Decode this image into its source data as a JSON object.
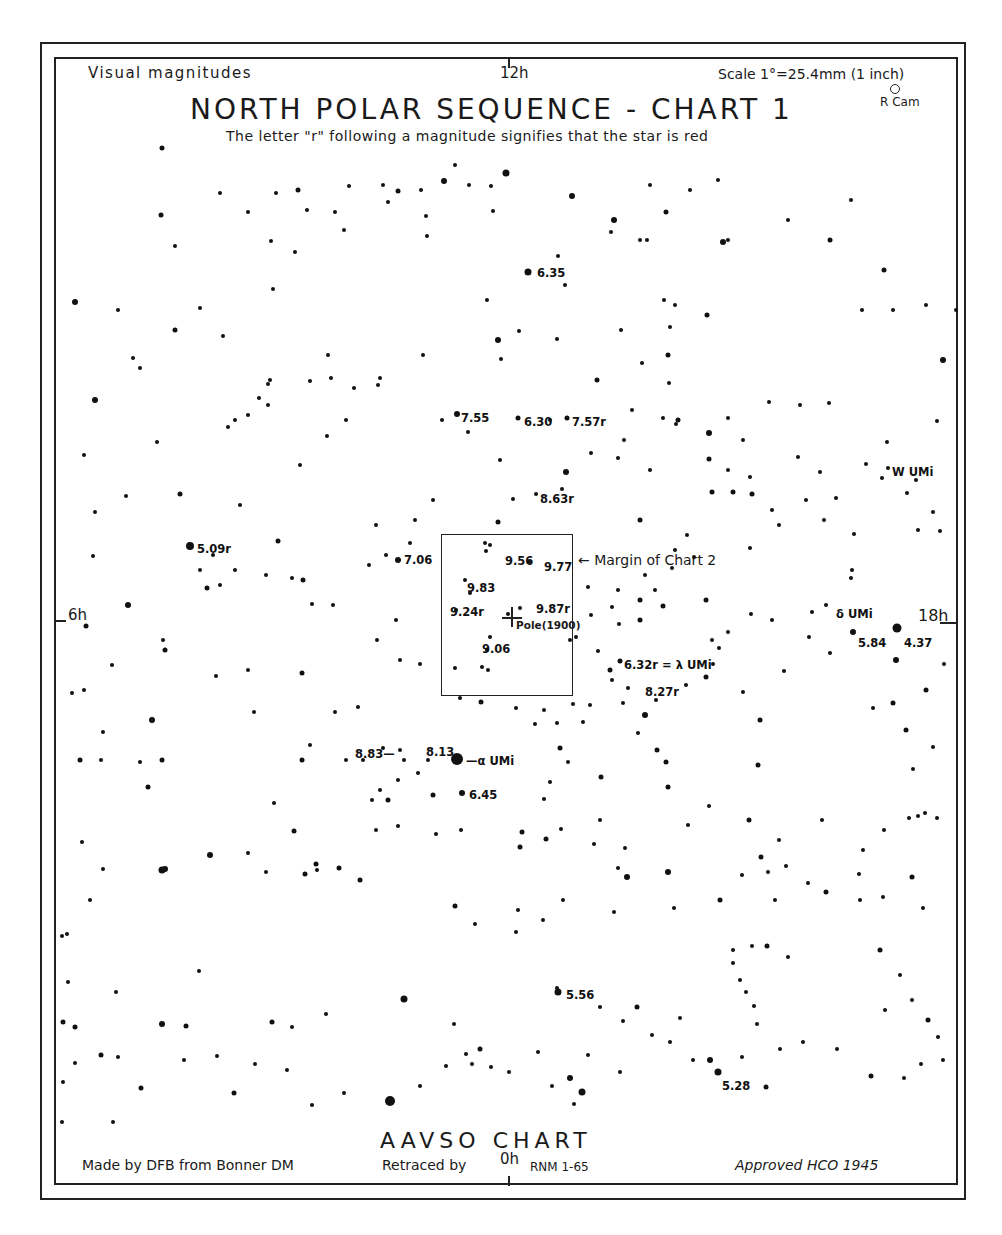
{
  "header": {
    "left": "Visual magnitudes",
    "ra_top": "12h",
    "scale": "Scale 1°=25.4mm (1 inch)",
    "title": "NORTH POLAR SEQUENCE - CHART 1",
    "subtitle": "The letter \"r\" following a magnitude signifies that the star is red",
    "corner_label": "R Cam"
  },
  "ra_marks": {
    "left": "6h",
    "right": "18h",
    "bottom": "0h"
  },
  "inset": {
    "label": "← Margin of Chart 2",
    "pole_label": "Pole(1900)"
  },
  "labels": [
    {
      "text": "6.35",
      "x": 537,
      "y": 264
    },
    {
      "text": "7.55",
      "x": 461,
      "y": 409
    },
    {
      "text": "6.30",
      "x": 524,
      "y": 413
    },
    {
      "text": "7.57r",
      "x": 572,
      "y": 413
    },
    {
      "text": "8.63r",
      "x": 540,
      "y": 490
    },
    {
      "text": "5.09r",
      "x": 197,
      "y": 540
    },
    {
      "text": "7.06",
      "x": 404,
      "y": 551
    },
    {
      "text": "9.56",
      "x": 505,
      "y": 552
    },
    {
      "text": "9.77",
      "x": 544,
      "y": 558
    },
    {
      "text": "9.83",
      "x": 467,
      "y": 579
    },
    {
      "text": "9.24r",
      "x": 450,
      "y": 603
    },
    {
      "text": "9.87r",
      "x": 536,
      "y": 600
    },
    {
      "text": "9.06",
      "x": 482,
      "y": 640
    },
    {
      "text": "6.32r = λ UMi",
      "x": 624,
      "y": 656
    },
    {
      "text": "8.27r",
      "x": 645,
      "y": 683
    },
    {
      "text": "8.83—",
      "x": 355,
      "y": 745
    },
    {
      "text": "8.13",
      "x": 426,
      "y": 743
    },
    {
      "text": "—α UMi",
      "x": 466,
      "y": 752
    },
    {
      "text": "6.45",
      "x": 469,
      "y": 786
    },
    {
      "text": "W UMi",
      "x": 892,
      "y": 463
    },
    {
      "text": "δ UMi",
      "x": 836,
      "y": 605
    },
    {
      "text": "5.84",
      "x": 858,
      "y": 634
    },
    {
      "text": "4.37",
      "x": 904,
      "y": 634
    },
    {
      "text": "5.56",
      "x": 566,
      "y": 986
    },
    {
      "text": "5.28",
      "x": 722,
      "y": 1077
    }
  ],
  "footer": {
    "chart_name": "AAVSO CHART",
    "made_by": "Made by DFB from Bonner DM",
    "retraced": "Retraced by",
    "retraced_by": "RNM 1-65",
    "approved": "Approved HCO 1945"
  },
  "chart_data": {
    "type": "scatter",
    "title": "NORTH POLAR SEQUENCE - CHART 1",
    "subtitle": "The letter \"r\" following a magnitude signifies that the star is red",
    "xlabel": "Right Ascension (hours)",
    "ylabel": "Declination",
    "axis_ticks": {
      "top": "12h",
      "left": "6h",
      "right": "18h",
      "bottom": "0h"
    },
    "scale": "1° = 25.4 mm (1 inch)",
    "magnitude_system": "Visual magnitudes",
    "labeled_stars": [
      {
        "magnitude": "6.35"
      },
      {
        "magnitude": "7.55"
      },
      {
        "magnitude": "6.30"
      },
      {
        "magnitude": "7.57",
        "red": true
      },
      {
        "magnitude": "8.63",
        "red": true
      },
      {
        "magnitude": "5.09",
        "red": true
      },
      {
        "magnitude": "7.06"
      },
      {
        "magnitude": "9.56"
      },
      {
        "magnitude": "9.77"
      },
      {
        "magnitude": "9.83"
      },
      {
        "magnitude": "9.24",
        "red": true
      },
      {
        "magnitude": "9.87",
        "red": true
      },
      {
        "magnitude": "9.06"
      },
      {
        "magnitude": "6.32",
        "red": true,
        "name": "λ UMi"
      },
      {
        "magnitude": "8.27",
        "red": true
      },
      {
        "magnitude": "8.83"
      },
      {
        "magnitude": "8.13"
      },
      {
        "name": "α UMi"
      },
      {
        "magnitude": "6.45"
      },
      {
        "name": "W UMi"
      },
      {
        "name": "δ UMi"
      },
      {
        "magnitude": "5.84"
      },
      {
        "magnitude": "4.37"
      },
      {
        "magnitude": "5.56"
      },
      {
        "magnitude": "5.28"
      },
      {
        "name": "R Cam"
      }
    ],
    "annotations": [
      "Margin of Chart 2",
      "Pole(1900)"
    ],
    "footer": [
      "AAVSO CHART",
      "Made by DFB from Bonner DM",
      "Retraced by RNM 1-65",
      "Approved HCO 1945"
    ]
  }
}
